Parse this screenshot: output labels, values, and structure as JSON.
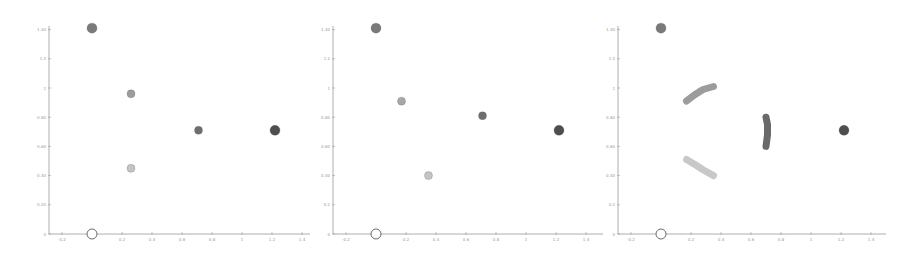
{
  "chart_data": [
    {
      "type": "scatter",
      "title": "",
      "xlabel": "",
      "ylabel": "",
      "xlim": [
        -0.25,
        1.45
      ],
      "ylim": [
        0,
        1.42
      ],
      "xticks": [
        -0.2,
        0,
        0.2,
        0.4,
        0.6,
        0.8,
        1,
        1.2,
        1.4
      ],
      "xtick_labels": [
        "-0.2",
        "",
        "0.2",
        "0.4",
        "0.6",
        "0.8",
        "1",
        "1.2",
        "1.4"
      ],
      "yticks": [
        0,
        0.2,
        0.4,
        0.6,
        0.8,
        1,
        1.2,
        1.4
      ],
      "ytick_labels": [
        "0",
        "0.20",
        "0.40",
        "0.60",
        "0.80",
        "1",
        "1.2",
        "1.40"
      ],
      "grid": false,
      "points": [
        {
          "x": 0,
          "y": 1.41,
          "color": "#7a7a7a",
          "r": 5,
          "style": "filled"
        },
        {
          "x": 0.26,
          "y": 0.96,
          "color": "#9c9c9c",
          "r": 4,
          "style": "filled"
        },
        {
          "x": 0.26,
          "y": 0.45,
          "color": "#c4c4c4",
          "r": 4,
          "style": "filled"
        },
        {
          "x": 0.71,
          "y": 0.71,
          "color": "#6e6e6e",
          "r": 4,
          "style": "filled"
        },
        {
          "x": 1.22,
          "y": 0.71,
          "color": "#4e4e4e",
          "r": 5,
          "style": "filled"
        },
        {
          "x": 0,
          "y": 0,
          "color": "#ffffff",
          "r": 5,
          "style": "open"
        }
      ],
      "arcs": []
    },
    {
      "type": "scatter",
      "title": "",
      "xlabel": "",
      "ylabel": "",
      "xlim": [
        -0.25,
        1.45
      ],
      "ylim": [
        0,
        1.42
      ],
      "xticks": [
        -0.2,
        0,
        0.2,
        0.4,
        0.6,
        0.8,
        1,
        1.2,
        1.4
      ],
      "xtick_labels": [
        "-0.2",
        "",
        "0.2",
        "0.4",
        "0.6",
        "0.8",
        "1",
        "1.2",
        "1.4"
      ],
      "yticks": [
        0,
        0.2,
        0.4,
        0.6,
        0.8,
        1,
        1.2,
        1.4
      ],
      "ytick_labels": [
        "0",
        "0.2",
        "0.40",
        "0.60",
        "0.80",
        "1",
        "1.2",
        "1.40"
      ],
      "grid": false,
      "points": [
        {
          "x": 0,
          "y": 1.41,
          "color": "#7a7a7a",
          "r": 5,
          "style": "filled"
        },
        {
          "x": 0.17,
          "y": 0.91,
          "color": "#a8a8a8",
          "r": 4,
          "style": "filled"
        },
        {
          "x": 0.35,
          "y": 0.4,
          "color": "#c4c4c4",
          "r": 4,
          "style": "filled"
        },
        {
          "x": 0.71,
          "y": 0.81,
          "color": "#6e6e6e",
          "r": 4,
          "style": "filled"
        },
        {
          "x": 1.22,
          "y": 0.71,
          "color": "#4e4e4e",
          "r": 5,
          "style": "filled"
        },
        {
          "x": 0,
          "y": 0,
          "color": "#ffffff",
          "r": 5,
          "style": "open"
        }
      ],
      "arcs": []
    },
    {
      "type": "scatter",
      "title": "",
      "xlabel": "",
      "ylabel": "",
      "xlim": [
        -0.25,
        1.45
      ],
      "ylim": [
        0,
        1.42
      ],
      "xticks": [
        -0.2,
        0,
        0.2,
        0.4,
        0.6,
        0.8,
        1,
        1.2,
        1.4
      ],
      "xtick_labels": [
        "-0.2",
        "",
        "0.2",
        "0.4",
        "0.6",
        "0.8",
        "1",
        "1.2",
        "1.4"
      ],
      "yticks": [
        0,
        0.2,
        0.4,
        0.6,
        0.8,
        1,
        1.2,
        1.4
      ],
      "ytick_labels": [
        "0",
        "0.2",
        "0.40",
        "0.60",
        "0.80",
        "1",
        "1.2",
        "1.40"
      ],
      "grid": false,
      "points": [
        {
          "x": 0,
          "y": 1.41,
          "color": "#7a7a7a",
          "r": 5,
          "style": "filled"
        },
        {
          "x": 1.22,
          "y": 0.71,
          "color": "#4e4e4e",
          "r": 5,
          "style": "filled"
        },
        {
          "x": 0,
          "y": 0,
          "color": "#ffffff",
          "r": 5,
          "style": "open"
        }
      ],
      "arcs": [
        {
          "name": "gray-arc",
          "color": "#9c9c9c",
          "width": 7,
          "path": [
            [
              0.17,
              0.91
            ],
            [
              0.22,
              0.95
            ],
            [
              0.28,
              0.99
            ],
            [
              0.35,
              1.01
            ]
          ]
        },
        {
          "name": "light-arc",
          "color": "#c8c8c8",
          "width": 7,
          "path": [
            [
              0.17,
              0.51
            ],
            [
              0.22,
              0.48
            ],
            [
              0.28,
              0.44
            ],
            [
              0.35,
              0.4
            ]
          ]
        },
        {
          "name": "dark-arc",
          "color": "#6a6a6a",
          "width": 7,
          "path": [
            [
              0.7,
              0.8
            ],
            [
              0.71,
              0.75
            ],
            [
              0.71,
              0.68
            ],
            [
              0.7,
              0.6
            ]
          ]
        }
      ]
    }
  ],
  "layout": {
    "panels": [
      {
        "left": 0,
        "axis_x": 49,
        "x0_px": 92,
        "x_end": 310
      },
      {
        "left": 0,
        "axis_x": 333,
        "x0_px": 376,
        "x_end": 603
      },
      {
        "left": 0,
        "axis_x": 618,
        "x0_px": 661,
        "x_end": 886
      }
    ],
    "y0_px": 234,
    "x_scale": 150,
    "y_scale": 146
  }
}
